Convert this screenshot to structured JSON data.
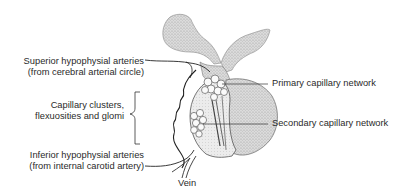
{
  "diagram": {
    "labels": {
      "superior_arteries_line1": "Superior hypophysial arteries",
      "superior_arteries_line2": "(from cerebral arterial circle)",
      "capillary_clusters_line1": "Capillary clusters,",
      "capillary_clusters_line2": "flexuosities and glomi",
      "inferior_arteries_line1": "Inferior hypophysial arteries",
      "inferior_arteries_line2": "(from internal carotid artery)",
      "vein": "Vein",
      "primary_network": "Primary capillary network",
      "secondary_network": "Secondary capillary network"
    },
    "colors": {
      "stipple": "#b9b9b9",
      "lobe": "#cfcfcf",
      "line": "#333333"
    }
  }
}
